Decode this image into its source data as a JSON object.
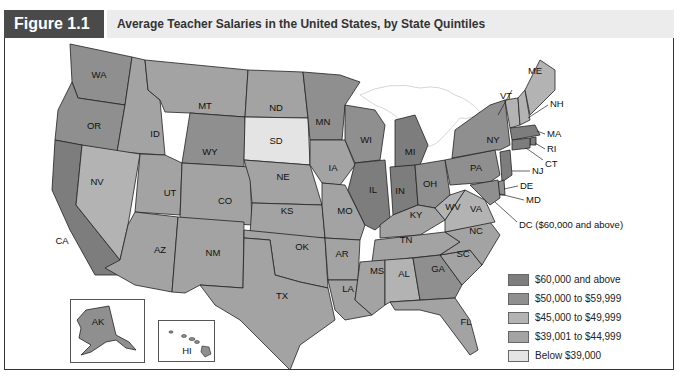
{
  "figure": {
    "label": "Figure 1.1",
    "title": "Average Teacher Salaries in the United States, by State Quintiles"
  },
  "colors": {
    "q1": "#7d7d7d",
    "q2": "#8f8f8f",
    "q3": "#b3b3b3",
    "q4": "#a3a3a3",
    "q5": "#e4e4e4",
    "header_dark": "#4a4a4a",
    "header_light": "#ececec"
  },
  "legend": {
    "items": [
      {
        "label": "$60,000 and above",
        "color": "#7d7d7d"
      },
      {
        "label": "$50,000 to $59,999",
        "color": "#8f8f8f"
      },
      {
        "label": "$45,000 to $49,999",
        "color": "#b3b3b3"
      },
      {
        "label": "$39,001 to $44,999",
        "color": "#a3a3a3"
      },
      {
        "label": "Below $39,000",
        "color": "#e4e4e4"
      }
    ]
  },
  "states": {
    "WA": "WA",
    "OR": "OR",
    "CA": "CA",
    "ID": "ID",
    "NV": "NV",
    "MT": "MT",
    "WY": "WY",
    "UT": "UT",
    "AZ": "AZ",
    "CO": "CO",
    "NM": "NM",
    "ND": "ND",
    "SD": "SD",
    "NE": "NE",
    "KS": "KS",
    "OK": "OK",
    "TX": "TX",
    "MN": "MN",
    "IA": "IA",
    "MO": "MO",
    "AR": "AR",
    "LA": "LA",
    "WI": "WI",
    "IL": "IL",
    "MI": "MI",
    "IN": "IN",
    "OH": "OH",
    "KY": "KY",
    "TN": "TN",
    "MS": "MS",
    "AL": "AL",
    "GA": "GA",
    "FL": "FL",
    "SC": "SC",
    "NC": "NC",
    "VA": "VA",
    "WV": "WV",
    "PA": "PA",
    "NY": "NY",
    "VT": "VT",
    "NH": "NH",
    "ME": "ME",
    "MA": "MA",
    "RI": "RI",
    "CT": "CT",
    "NJ": "NJ",
    "DE": "DE",
    "MD": "MD",
    "AK": "AK",
    "HI": "HI"
  },
  "callouts": {
    "dc": "DC ($60,000 and above)"
  }
}
